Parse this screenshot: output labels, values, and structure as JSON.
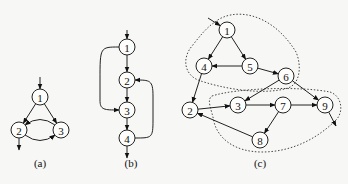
{
  "figures": [
    {
      "id": "a",
      "caption": "(a)",
      "nodes": [
        "1",
        "2",
        "3"
      ],
      "entry": "1",
      "exits": [
        "2"
      ],
      "edges": [
        [
          "1",
          "2"
        ],
        [
          "1",
          "3"
        ],
        [
          "2",
          "3"
        ],
        [
          "3",
          "2"
        ]
      ]
    },
    {
      "id": "b",
      "caption": "(b)",
      "nodes": [
        "1",
        "2",
        "3",
        "4"
      ],
      "entry": "1",
      "exits": [
        "4"
      ],
      "edges": [
        [
          "1",
          "2"
        ],
        [
          "2",
          "3"
        ],
        [
          "3",
          "4"
        ],
        [
          "1",
          "3"
        ],
        [
          "4",
          "2"
        ]
      ]
    },
    {
      "id": "c",
      "caption": "(c)",
      "nodes": [
        "1",
        "2",
        "3",
        "4",
        "5",
        "6",
        "7",
        "8",
        "9"
      ],
      "entry": "1",
      "exits": [
        "9"
      ],
      "edges": [
        [
          "1",
          "4"
        ],
        [
          "1",
          "5"
        ],
        [
          "5",
          "4"
        ],
        [
          "5",
          "6"
        ],
        [
          "4",
          "2"
        ],
        [
          "6",
          "3"
        ],
        [
          "6",
          "9"
        ],
        [
          "2",
          "3"
        ],
        [
          "3",
          "7"
        ],
        [
          "7",
          "9"
        ],
        [
          "7",
          "8"
        ],
        [
          "8",
          "2"
        ]
      ],
      "regions": [
        {
          "nodes": [
            "1",
            "4",
            "5",
            "6"
          ],
          "style": "dotted"
        },
        {
          "nodes": [
            "3",
            "7",
            "8",
            "9"
          ],
          "style": "dotted"
        }
      ]
    }
  ]
}
